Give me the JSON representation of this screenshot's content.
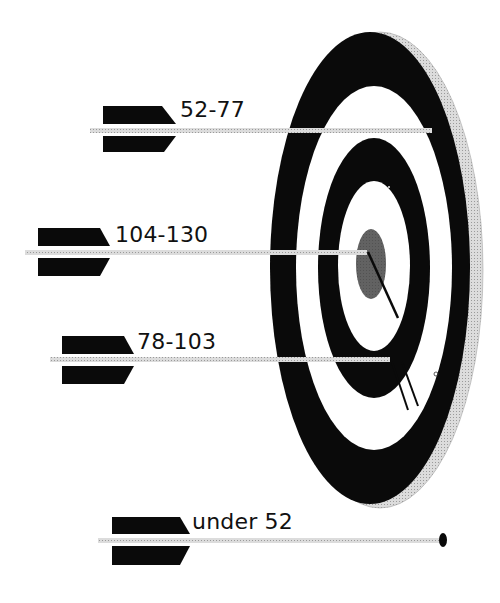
{
  "diagram": {
    "type": "target-with-arrows",
    "colors": {
      "ring_dark": "#0a0a0a",
      "ring_light": "#ffffff",
      "bullseye": "#3a3a3a",
      "shaft": "#d4d4d4",
      "fletching": "#0a0a0a",
      "board_edge": "#c8c8c8"
    },
    "arrows": [
      {
        "label": "52-77"
      },
      {
        "label": "104-130"
      },
      {
        "label": "78-103"
      },
      {
        "label": "under 52"
      }
    ]
  }
}
